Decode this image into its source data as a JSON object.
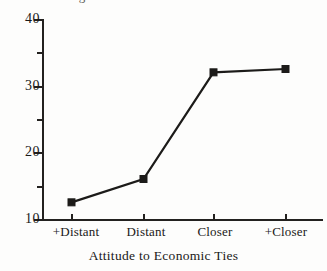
{
  "figure": {
    "background_color": "#fdfdfc",
    "ink_color": "#1c1b19",
    "clipped_title_remnant": "Percentage"
  },
  "chart_data": {
    "type": "line",
    "title": "",
    "subtitle": "",
    "xlabel": "Attitude to Economic Ties",
    "ylabel": "",
    "categories": [
      "+Distant",
      "Distant",
      "Closer",
      "+Closer"
    ],
    "values": [
      12.5,
      16.0,
      32.0,
      32.5
    ],
    "series": [
      {
        "name": "",
        "values": [
          12.5,
          16.0,
          32.0,
          32.5
        ],
        "marker": "square",
        "color": "#1c1b19"
      }
    ],
    "ylim": [
      10,
      40
    ],
    "y_major_ticks": [
      10,
      20,
      30,
      40
    ],
    "y_minor_ticks": [
      15,
      25,
      35
    ],
    "y_tick_labels": [
      "10",
      "20",
      "30",
      "40"
    ],
    "x_tick_labels": [
      "+Distant",
      "Distant",
      "Closer",
      "+Closer"
    ],
    "grid": false,
    "legend": false,
    "legend_position": "none"
  },
  "axes": {
    "y_labels": [
      "40",
      "30",
      "20",
      "10"
    ],
    "x_labels": [
      "+Distant",
      "Distant",
      "Closer",
      "+Closer"
    ],
    "x_title": "Attitude to Economic Ties"
  }
}
